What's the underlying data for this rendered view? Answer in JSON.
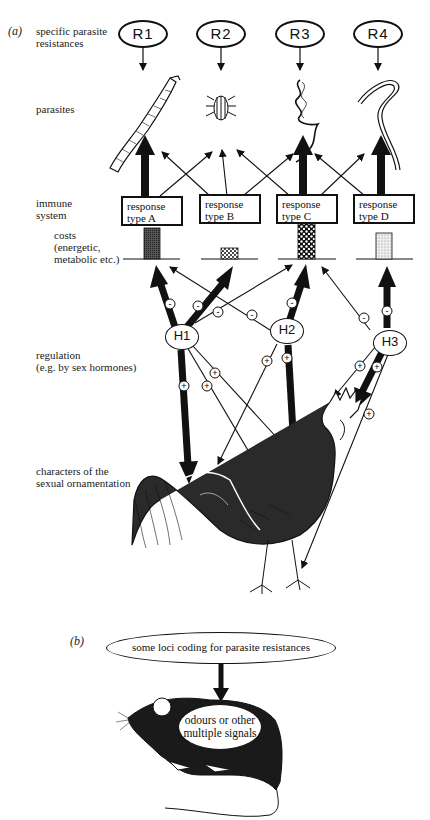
{
  "figure": {
    "panel_a": {
      "tag": "(a)",
      "row_labels": {
        "resistances_1": "specific parasite",
        "resistances_2": "resistances",
        "parasites": "parasites",
        "immune_1": "immune",
        "immune_2": "system",
        "costs_1": "costs",
        "costs_2": "(energetic,",
        "costs_3": "metabolic etc.)",
        "regulation_1": "regulation",
        "regulation_2": "(e.g. by sex hormones)",
        "characters_1": "characters of the",
        "characters_2": "sexual ornamentation"
      },
      "resistances": [
        "R1",
        "R2",
        "R3",
        "R4"
      ],
      "parasites": [
        "tapeworm",
        "mite",
        "twisted-worm",
        "nematode"
      ],
      "responses": [
        {
          "line1": "response",
          "line2": "type A"
        },
        {
          "line1": "response",
          "line2": "type B"
        },
        {
          "line1": "response",
          "line2": "type C"
        },
        {
          "line1": "response",
          "line2": "type D"
        }
      ],
      "costs": [
        {
          "response": "A",
          "relative_height": 0.85,
          "pattern": "dark-fine"
        },
        {
          "response": "B",
          "relative_height": 0.3,
          "pattern": "dots-dense"
        },
        {
          "response": "C",
          "relative_height": 1.0,
          "pattern": "black-with-white-dots"
        },
        {
          "response": "D",
          "relative_height": 0.7,
          "pattern": "light-stipple"
        }
      ],
      "hormones": [
        "H1",
        "H2",
        "H3"
      ],
      "signs": {
        "minus": "-",
        "plus": "+"
      },
      "ornament_subject": "rooster"
    },
    "panel_b": {
      "tag": "(b)",
      "top_oval": "some loci coding for parasite resistances",
      "inner_oval_1": "odours or other",
      "inner_oval_2": "multiple signals",
      "subject": "mouse"
    }
  }
}
